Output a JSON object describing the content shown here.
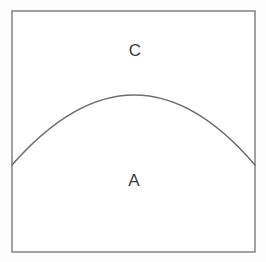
{
  "figure": {
    "background_color": "#fdfdfd",
    "canvas_fill": "#ffffff",
    "outline_color": "#8a8a8a",
    "arc_color": "#6e6e6e",
    "label_color": "#3a3a3a",
    "outline_stroke_width": 1.6,
    "arc_stroke_width": 1.5,
    "square": {
      "left": 12,
      "top": 11,
      "right": 255,
      "bottom": 252,
      "width": 243,
      "height": 241
    },
    "arc": {
      "start_x": 12,
      "start_y": 165,
      "end_x": 255,
      "end_y": 165,
      "apex_x": 135,
      "apex_y": 95,
      "path": "M 12 165 Q 135 25 255 165"
    },
    "labels": [
      {
        "name": "region-label-c",
        "text": "C",
        "x": 135,
        "y": 52,
        "region": "above-arc"
      },
      {
        "name": "region-label-a",
        "text": "A",
        "x": 134,
        "y": 182,
        "region": "below-arc"
      }
    ]
  }
}
